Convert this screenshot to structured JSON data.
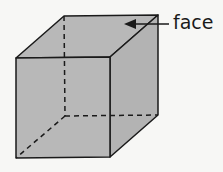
{
  "diagram": {
    "shape": "cube",
    "label": "face",
    "colors": {
      "fill": "#b8b8b8",
      "stroke": "#1a1a1a",
      "background": "#f7f7f5"
    }
  }
}
